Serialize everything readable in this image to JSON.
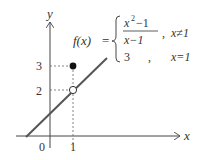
{
  "diagram": {
    "axes": {
      "x_label": "x",
      "y_label": "y",
      "origin_label": "0",
      "x_ticks": [
        "1"
      ],
      "y_ticks": [
        "2",
        "3"
      ]
    },
    "function": {
      "lhs": "f(x)",
      "equals": "=",
      "case1_numerator_base": "x",
      "case1_numerator_exp": "2",
      "case1_numerator_rest": "−1",
      "case1_denominator": "x−1",
      "case1_sep": ",",
      "case1_condition": "x≠1",
      "case2_value": "3",
      "case2_sep": ",",
      "case2_condition": "x=1"
    },
    "points": [
      {
        "x": 1,
        "y": 3,
        "filled": true
      },
      {
        "x": 1,
        "y": 2,
        "filled": false
      }
    ],
    "line": {
      "slope": 1,
      "intercept": 1
    },
    "colors": {
      "line": "#555555",
      "axis": "#444444",
      "dashed": "#666666",
      "text": "#333333"
    }
  }
}
